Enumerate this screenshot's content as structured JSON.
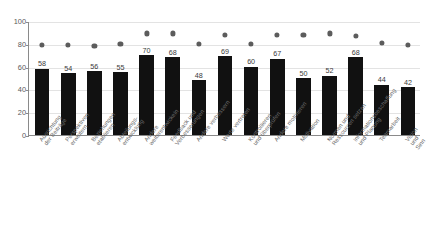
{
  "chart_data": {
    "type": "bar",
    "title": "",
    "subtitle": "",
    "xlabel": "",
    "ylabel": "",
    "ylim": [
      0,
      100
    ],
    "yticks": [
      0,
      20,
      40,
      60,
      80,
      100
    ],
    "grid": true,
    "legend": "none",
    "categories": [
      "Ausrichtung\nder Beiträge",
      "Perspektiven\nerweitern",
      "Beziehungen\netablieren",
      "Abteilungs-\nentwicklung",
      "Andere\nweiterentwickeln",
      "Feedback und\nVerbesserungen",
      "Andere verbessern",
      "Werte vertreten",
      "Kontrollieren\nund überprüfen",
      "Andere motivieren",
      "Motivation",
      "Normen und\nRessourcen setzen",
      "Informationsbeschaffung\nund Planung",
      "Teamarbeit",
      "Vision und Sinn"
    ],
    "series": [
      {
        "name": "Wert",
        "type": "bar",
        "color": "#111111",
        "values": [
          58,
          54,
          56,
          55,
          70,
          68,
          48,
          69,
          60,
          67,
          50,
          52,
          68,
          44,
          42
        ],
        "data_labels": [
          "58",
          "54",
          "56",
          "55",
          "70",
          "68",
          "48",
          "69",
          "60",
          "67",
          "50",
          "52",
          "68",
          "44",
          "42"
        ]
      },
      {
        "name": "Referenzpunkt",
        "type": "scatter",
        "color": "#5c5c5c",
        "values": [
          80,
          80,
          79,
          80.5,
          90,
          90,
          80.5,
          89,
          80.5,
          88.5,
          88.5,
          90,
          88,
          82,
          80
        ]
      }
    ]
  },
  "axis": {
    "y_tick_labels": [
      "100",
      "80",
      "60",
      "40",
      "20",
      "0"
    ]
  }
}
